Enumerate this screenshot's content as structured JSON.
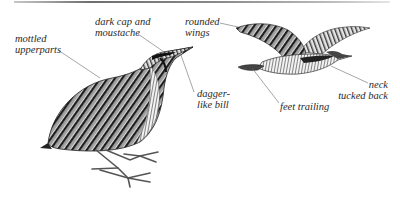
{
  "figure": {
    "colors": {
      "ink": "#2a2a2a",
      "leader": "#6a6a6a",
      "background": "#ffffff",
      "bar": "#7a7a7a"
    }
  },
  "labels": {
    "mottled": {
      "line1": "mottled",
      "line2": "upperparts"
    },
    "cap": {
      "line1": "dark cap and",
      "line2": "moustache"
    },
    "wings": {
      "line1": "rounded",
      "line2": "wings"
    },
    "bill": {
      "line1": "dagger-",
      "line2": "like bill"
    },
    "neck": {
      "line1": "neck",
      "line2": "tucked back"
    },
    "feet": {
      "line1": "feet trailing"
    }
  }
}
